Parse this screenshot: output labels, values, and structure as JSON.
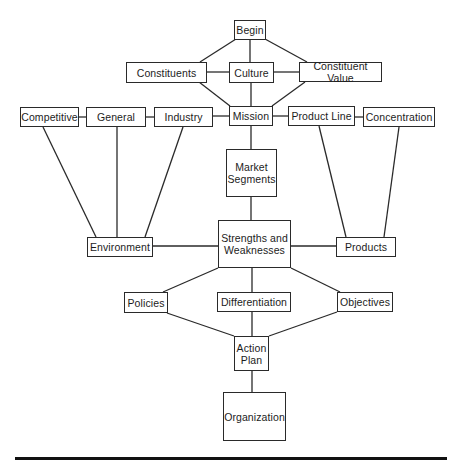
{
  "diagram": {
    "type": "flowchart",
    "nodes": {
      "begin": {
        "label": "Begin"
      },
      "constituents": {
        "label": "Constituents"
      },
      "culture": {
        "label": "Culture"
      },
      "constituent_value": {
        "label": "Constituent Value"
      },
      "competitive": {
        "label": "Competitive"
      },
      "general": {
        "label": "General"
      },
      "industry": {
        "label": "Industry"
      },
      "mission": {
        "label": "Mission"
      },
      "product_line": {
        "label": "Product Line"
      },
      "concentration": {
        "label": "Concentration"
      },
      "market_segments": {
        "label": "Market\nSegments"
      },
      "environment": {
        "label": "Environment"
      },
      "strengths_weaknesses": {
        "label": "Strengths and\nWeaknesses"
      },
      "products": {
        "label": "Products"
      },
      "policies": {
        "label": "Policies"
      },
      "differentiation": {
        "label": "Differentiation"
      },
      "objectives": {
        "label": "Objectives"
      },
      "action_plan": {
        "label": "Action\nPlan"
      },
      "organization": {
        "label": "Organization"
      }
    },
    "edges": [
      [
        "begin",
        "constituents"
      ],
      [
        "begin",
        "culture"
      ],
      [
        "begin",
        "constituent_value"
      ],
      [
        "constituents",
        "culture"
      ],
      [
        "culture",
        "constituent_value"
      ],
      [
        "constituents",
        "mission"
      ],
      [
        "culture",
        "mission"
      ],
      [
        "constituent_value",
        "mission"
      ],
      [
        "competitive",
        "general"
      ],
      [
        "general",
        "industry"
      ],
      [
        "industry",
        "mission"
      ],
      [
        "mission",
        "product_line"
      ],
      [
        "product_line",
        "concentration"
      ],
      [
        "mission",
        "market_segments"
      ],
      [
        "market_segments",
        "strengths_weaknesses"
      ],
      [
        "competitive",
        "environment"
      ],
      [
        "general",
        "environment"
      ],
      [
        "industry",
        "environment"
      ],
      [
        "product_line",
        "products"
      ],
      [
        "concentration",
        "products"
      ],
      [
        "environment",
        "strengths_weaknesses"
      ],
      [
        "strengths_weaknesses",
        "products"
      ],
      [
        "strengths_weaknesses",
        "policies"
      ],
      [
        "strengths_weaknesses",
        "differentiation"
      ],
      [
        "strengths_weaknesses",
        "objectives"
      ],
      [
        "policies",
        "action_plan"
      ],
      [
        "differentiation",
        "action_plan"
      ],
      [
        "objectives",
        "action_plan"
      ],
      [
        "action_plan",
        "organization"
      ]
    ]
  }
}
